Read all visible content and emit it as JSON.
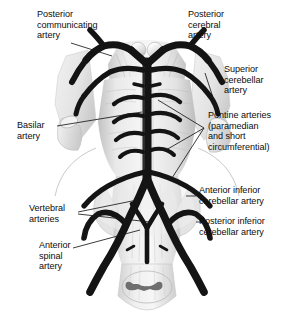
{
  "figure": {
    "view": "ventral",
    "background_color": "#ffffff",
    "artery_color": "#171717",
    "tissue_color": "#e8e8e8",
    "leader_line_color": "#1a1a1a"
  },
  "labels": {
    "posterior_communicating": "Posterior\ncommunicating\nartery",
    "posterior_cerebral": "Posterior\ncerebral\nartery",
    "superior_cerebellar": "Superior\ncerebellar\nartery",
    "pontine": "Pontine arteries\n(paramedian\nand short\ncircumferential)",
    "basilar": "Basilar\nartery",
    "anterior_inferior_cerebellar": "Anterior inferior\ncerebellar artery",
    "posterior_inferior_cerebellar": "Posterior inferior\ncerebellar artery",
    "vertebral": "Vertebral\narteries",
    "anterior_spinal": "Anterior\nspinal\nartery"
  },
  "structures": {
    "mammillary_bodies": "mammillary-bodies",
    "midbrain": "midbrain",
    "pons": "pons",
    "medulla": "medulla",
    "spinal_cord": "spinal-cord-cross-section",
    "temporal_lobe_left": "left-temporal-lobe",
    "temporal_lobe_right": "right-temporal-lobe",
    "cerebellar_peduncle_left": "left-cerebellar-peduncle",
    "cerebellar_peduncle_right": "right-cerebellar-peduncle"
  }
}
